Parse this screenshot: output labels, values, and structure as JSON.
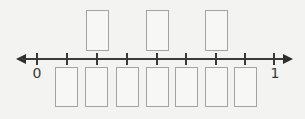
{
  "number_line": {
    "start_label": "0",
    "end_label": "1",
    "min": 0,
    "max": 1,
    "intervals": 8,
    "tick_x": [
      37,
      67,
      97,
      127,
      157,
      186,
      216,
      245,
      274
    ],
    "colors": {
      "line": "#3a3a3a",
      "box_border": "#a3a3a3",
      "background": "#f3f3f1"
    }
  },
  "answer_boxes": {
    "top": [
      {
        "x": 86,
        "tick_index": 2,
        "value": ""
      },
      {
        "x": 146,
        "tick_index": 4,
        "value": ""
      },
      {
        "x": 205,
        "tick_index": 6,
        "value": ""
      }
    ],
    "bottom": [
      {
        "x": 55,
        "tick_index": 1,
        "value": ""
      },
      {
        "x": 85,
        "tick_index": 2,
        "value": ""
      },
      {
        "x": 116,
        "tick_index": 3,
        "value": ""
      },
      {
        "x": 146,
        "tick_index": 4,
        "value": ""
      },
      {
        "x": 175,
        "tick_index": 5,
        "value": ""
      },
      {
        "x": 205,
        "tick_index": 6,
        "value": ""
      },
      {
        "x": 234,
        "tick_index": 7,
        "value": ""
      }
    ]
  }
}
